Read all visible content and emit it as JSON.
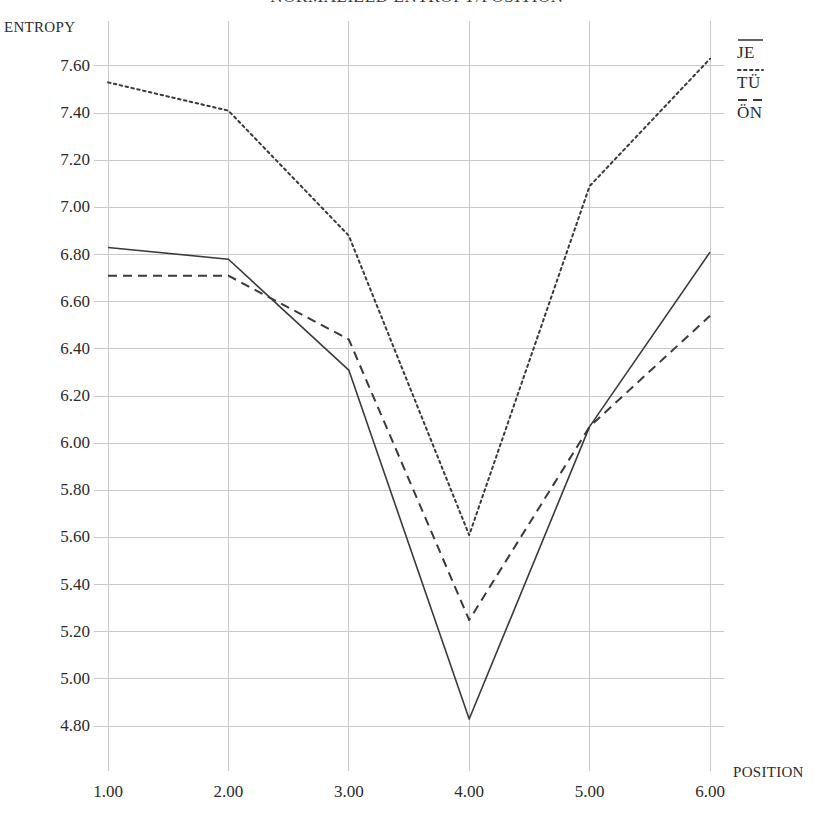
{
  "chart_data": {
    "type": "line",
    "title": "NORMALIZED ENTROPY/POSITION",
    "xlabel": "POSITION",
    "ylabel": "ENTROPY",
    "x": [
      1.0,
      2.0,
      3.0,
      4.0,
      5.0,
      6.0
    ],
    "x_tick_labels": [
      "1.00",
      "2.00",
      "3.00",
      "4.00",
      "5.00",
      "6.00"
    ],
    "y_ticks": [
      4.8,
      5.0,
      5.2,
      5.4,
      5.6,
      5.8,
      6.0,
      6.2,
      6.4,
      6.6,
      6.8,
      7.0,
      7.2,
      7.4,
      7.6
    ],
    "y_tick_labels": [
      "4.80",
      "5.00",
      "5.20",
      "5.40",
      "5.60",
      "5.80",
      "6.00",
      "6.20",
      "6.40",
      "6.60",
      "6.80",
      "7.00",
      "7.20",
      "7.40",
      "7.60"
    ],
    "xlim": [
      1.0,
      6.0
    ],
    "ylim": [
      4.72,
      7.68
    ],
    "grid": true,
    "legend_position": "right-top",
    "series": [
      {
        "name": "JE",
        "style": "solid",
        "color": "#3a3a3a",
        "values": [
          6.83,
          6.78,
          6.31,
          4.83,
          6.07,
          6.81
        ]
      },
      {
        "name": "TÜ",
        "style": "dotted",
        "color": "#3a3a3a",
        "values": [
          7.53,
          7.41,
          6.88,
          5.61,
          7.09,
          7.63
        ]
      },
      {
        "name": "ÖN",
        "style": "dashed",
        "color": "#3a3a3a",
        "values": [
          6.71,
          6.71,
          6.44,
          5.25,
          6.07,
          6.54
        ]
      }
    ]
  },
  "legend": {
    "entries": [
      {
        "label": "JE",
        "style": "solid"
      },
      {
        "label": "TÜ",
        "style": "dotted"
      },
      {
        "label": "ÖN",
        "style": "dashed"
      }
    ]
  },
  "colors": {
    "ink": "#3a3a3a",
    "grid": "#c9c9c9",
    "axis": "#8a8a8a",
    "background": "#ffffff"
  }
}
